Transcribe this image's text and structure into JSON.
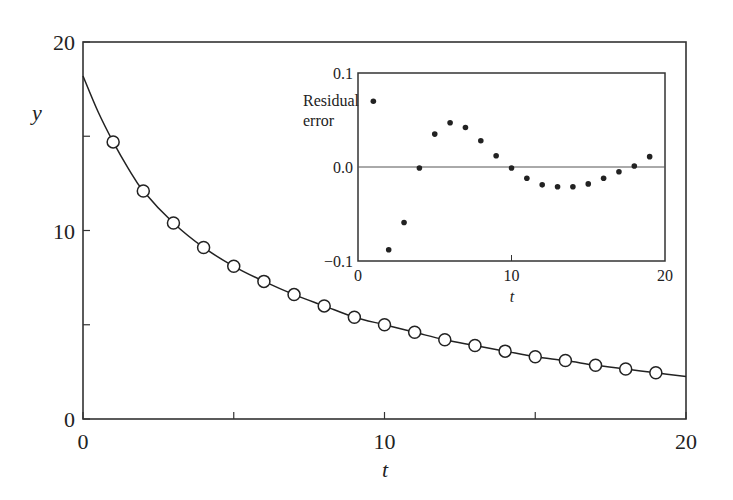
{
  "chart_data": [
    {
      "name": "main",
      "type": "scatter",
      "title": "",
      "xlabel": "t",
      "ylabel": "y",
      "xlim": [
        0,
        20
      ],
      "ylim": [
        0,
        20
      ],
      "xticks": [
        0,
        5,
        10,
        15,
        20
      ],
      "xtick_labels": [
        "0",
        "",
        "10",
        "",
        "20"
      ],
      "yticks": [
        0,
        5,
        10,
        15,
        20
      ],
      "ytick_labels": [
        "0",
        "",
        "10",
        "",
        "20"
      ],
      "grid": false,
      "series": [
        {
          "name": "data",
          "marker": "open-circle",
          "x": [
            1,
            2,
            3,
            4,
            5,
            6,
            7,
            8,
            9,
            10,
            11,
            12,
            13,
            14,
            15,
            16,
            17,
            18,
            19
          ],
          "y": [
            14.7,
            12.1,
            10.4,
            9.1,
            8.1,
            7.3,
            6.6,
            6.0,
            5.4,
            5.0,
            4.6,
            4.2,
            3.9,
            3.6,
            3.3,
            3.1,
            2.85,
            2.65,
            2.45
          ]
        },
        {
          "name": "fit",
          "style": "line",
          "x": [
            0,
            0.5,
            1,
            1.5,
            2,
            3,
            4,
            5,
            6,
            7,
            8,
            9,
            10,
            11,
            12,
            13,
            14,
            15,
            16,
            17,
            18,
            19,
            20
          ],
          "y": [
            18.2,
            16.3,
            14.7,
            13.3,
            12.1,
            10.4,
            9.1,
            8.1,
            7.3,
            6.6,
            6.0,
            5.4,
            5.0,
            4.6,
            4.2,
            3.9,
            3.6,
            3.3,
            3.1,
            2.85,
            2.65,
            2.45,
            2.25
          ]
        }
      ]
    },
    {
      "name": "inset",
      "type": "scatter",
      "title": "",
      "xlabel": "t",
      "ylabel": "Residual error",
      "ylabel_lines": [
        "Residual",
        "error"
      ],
      "xlim": [
        0,
        20
      ],
      "ylim": [
        -0.1,
        0.1
      ],
      "xticks": [
        0,
        10,
        20
      ],
      "xtick_labels": [
        "0",
        "10",
        "20"
      ],
      "yticks": [
        -0.1,
        0.0,
        0.1
      ],
      "ytick_labels": [
        "−0.1",
        "0.0",
        "0.1"
      ],
      "reference_line": 0.0,
      "grid": false,
      "series": [
        {
          "name": "residuals",
          "marker": "filled-dot",
          "x": [
            1,
            2,
            3,
            4,
            5,
            6,
            7,
            8,
            9,
            10,
            11,
            12,
            13,
            14,
            15,
            16,
            17,
            18,
            19
          ],
          "y": [
            0.07,
            -0.088,
            -0.059,
            -0.001,
            0.035,
            0.047,
            0.042,
            0.028,
            0.012,
            -0.001,
            -0.012,
            -0.019,
            -0.021,
            -0.021,
            -0.018,
            -0.012,
            -0.005,
            0.001,
            0.011
          ]
        }
      ]
    }
  ],
  "style": {
    "ink": "#222222",
    "frame": "#333333",
    "background": "#ffffff"
  }
}
